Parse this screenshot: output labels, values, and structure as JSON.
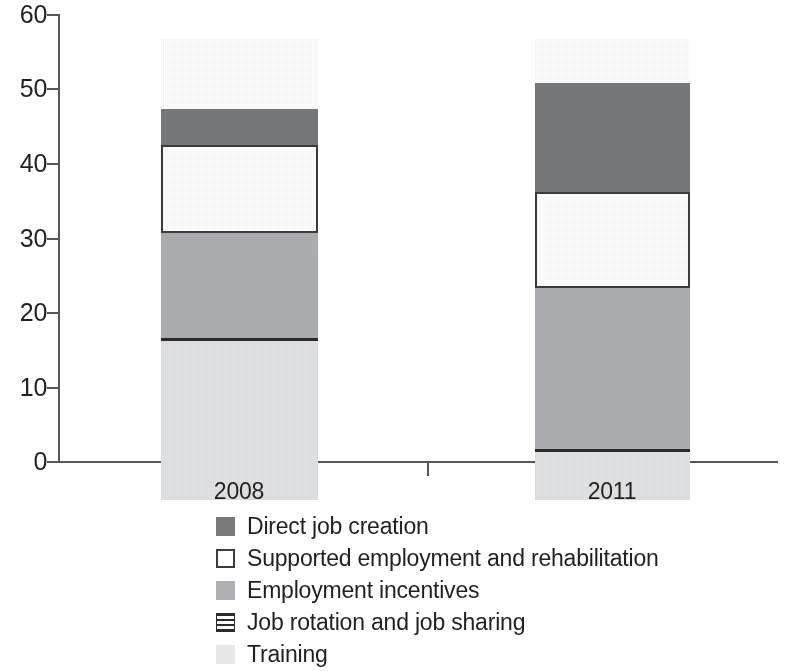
{
  "chart_data": {
    "type": "bar",
    "subtype": "stacked-bar",
    "title": "",
    "xlabel": "",
    "ylabel": "",
    "categories": [
      "2008",
      "2011"
    ],
    "ylim": [
      0,
      60
    ],
    "yticks": [
      0,
      10,
      20,
      30,
      40,
      50,
      60
    ],
    "ytick_labels": [
      "0",
      "10",
      "20",
      "30",
      "40",
      "50",
      "60"
    ],
    "grid": false,
    "legend_position": "bottom",
    "stack_order_bottom_to_top": [
      "Training",
      "Job rotation and job sharing",
      "Employment incentives",
      "Supported employment and rehabilitation",
      "Direct job creation"
    ],
    "series": [
      {
        "name": "Direct job creation",
        "color": "#77797b",
        "values": [
          4.8,
          14.7
        ]
      },
      {
        "name": "Supported employment and rehabilitation",
        "color": "#ffffff",
        "values": [
          11.9,
          12.8
        ]
      },
      {
        "name": "Employment incentives",
        "color": "#adafb2",
        "values": [
          14.1,
          21.6
        ]
      },
      {
        "name": "Job rotation and job sharing",
        "color": "#2b2b2b",
        "values": [
          0.4,
          0.4
        ]
      },
      {
        "name": "Training",
        "color": "#e2e3e4",
        "values": [
          21.3,
          6.5
        ]
      }
    ],
    "totals": [
      52.5,
      56.0
    ],
    "cumulative_tops": {
      "2008": {
        "Training": 21.3,
        "Job rotation and job sharing": 21.7,
        "Employment incentives": 35.8,
        "Supported employment and rehabilitation": 47.7,
        "Direct job creation": 52.5
      },
      "2011": {
        "Training": 6.5,
        "Job rotation and job sharing": 6.9,
        "Employment incentives": 28.5,
        "Supported employment and rehabilitation": 41.3,
        "Direct job creation": 56.0
      }
    }
  },
  "axis": {
    "y_ticks": [
      {
        "label": "60",
        "value": 60
      },
      {
        "label": "50",
        "value": 50
      },
      {
        "label": "40",
        "value": 40
      },
      {
        "label": "30",
        "value": 30
      },
      {
        "label": "20",
        "value": 20
      },
      {
        "label": "10",
        "value": 10
      },
      {
        "label": "0",
        "value": 0
      }
    ],
    "x_ticks": [
      {
        "label": "2008"
      },
      {
        "label": "2011"
      }
    ]
  },
  "legend": {
    "items": [
      {
        "label": "Direct job creation",
        "swatch": "solid-dark-gray"
      },
      {
        "label": "Supported employment and rehabilitation",
        "swatch": "outlined-white"
      },
      {
        "label": "Employment incentives",
        "swatch": "solid-medium-gray"
      },
      {
        "label": "Job rotation and job sharing",
        "swatch": "horizontal-lines"
      },
      {
        "label": "Training",
        "swatch": "solid-light-gray"
      }
    ]
  }
}
